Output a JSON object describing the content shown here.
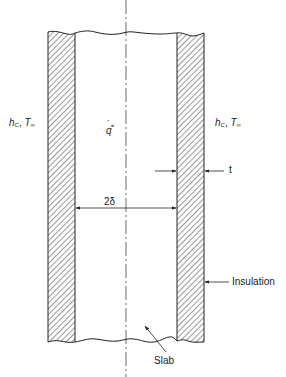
{
  "figure": {
    "type": "slab-with-insulation-cross-section",
    "colors": {
      "line": "#222222",
      "hatch": "#333333",
      "background": "#ffffff"
    }
  },
  "labels": {
    "left_convection": {
      "h": "h",
      "h_sub": "C",
      "sep": ", ",
      "T": "T",
      "T_sub": "∞"
    },
    "right_convection": {
      "h": "h",
      "h_sub": "C",
      "sep": ", ",
      "T": "T",
      "T_sub": "∞"
    },
    "heat_generation": {
      "symbol": "q",
      "dot": "˙",
      "primes": "‴"
    },
    "thickness": "t",
    "slab_width": "2δ",
    "insulation": "Insulation",
    "slab": "Slab"
  }
}
